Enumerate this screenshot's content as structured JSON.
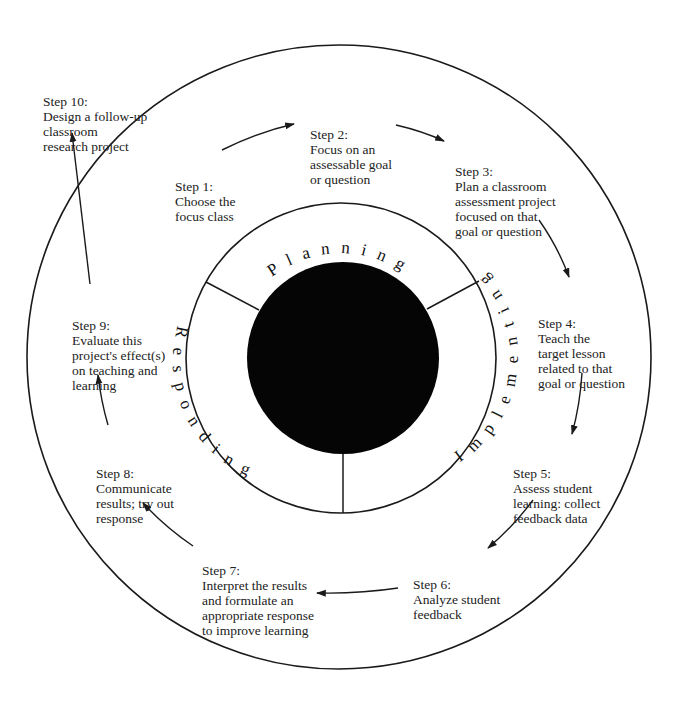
{
  "diagram": {
    "type": "cycle",
    "center_phases": [
      {
        "id": "planning",
        "label": "Planning"
      },
      {
        "id": "implementing",
        "label": "Implementing"
      },
      {
        "id": "responding",
        "label": "Responding"
      }
    ],
    "steps": [
      {
        "id": 1,
        "title": "Step 1:",
        "body": "Choose the\nfocus class"
      },
      {
        "id": 2,
        "title": "Step 2:",
        "body": "Focus on an\nassessable goal\nor question"
      },
      {
        "id": 3,
        "title": "Step 3:",
        "body": "Plan a classroom\nassessment project\nfocused on that\ngoal or question"
      },
      {
        "id": 4,
        "title": "Step 4:",
        "body": "Teach the\ntarget lesson\nrelated to that\ngoal or question"
      },
      {
        "id": 5,
        "title": "Step 5:",
        "body": "Assess student\nlearning: collect\nfeedback data"
      },
      {
        "id": 6,
        "title": "Step 6:",
        "body": "Analyze student\nfeedback"
      },
      {
        "id": 7,
        "title": "Step 7:",
        "body": "Interpret the results\nand formulate an\nappropriate response\nto improve learning"
      },
      {
        "id": 8,
        "title": "Step 8:",
        "body": "Communicate\nresults; try out\nresponse"
      },
      {
        "id": 9,
        "title": "Step 9:",
        "body": "Evaluate this\nproject's effect(s)\non teaching and\nlearning"
      },
      {
        "id": 10,
        "title": "Step 10:",
        "body": "Design a follow-up\nclassroom\nresearch project"
      }
    ],
    "flow": [
      "1->2",
      "2->3",
      "3->4",
      "4->5",
      "5->6",
      "6->7",
      "7->8",
      "8->9",
      "9->10"
    ],
    "colors": {
      "line": "#1a1a1a",
      "core": "#050505",
      "background": "#ffffff"
    }
  }
}
